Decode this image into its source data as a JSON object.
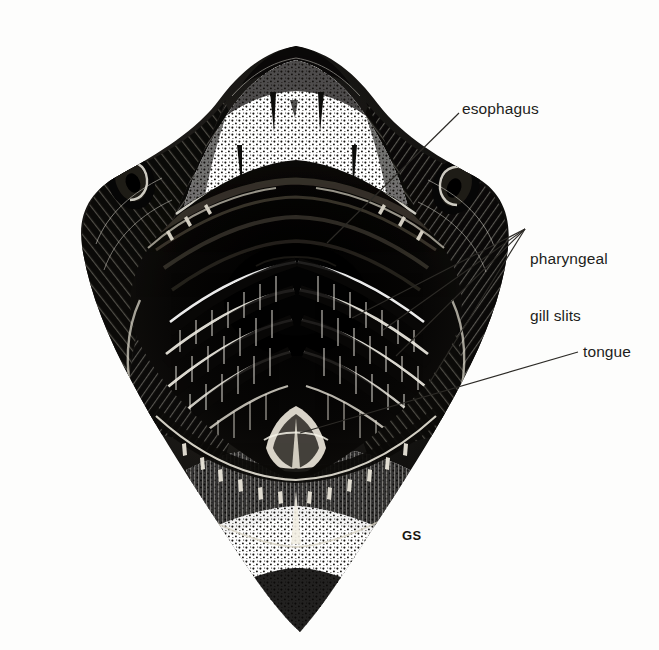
{
  "figure": {
    "medium": "pen-and-ink stipple and line engraving",
    "background_color": "#fdfdfc",
    "ink_color": "#111111",
    "signature": "GS"
  },
  "labels": {
    "esophagus": "esophagus",
    "gill_slits_line1": "pharyngeal",
    "gill_slits_line2": "gill slits",
    "tongue": "tongue"
  },
  "leaders": {
    "esophagus": {
      "from_x": 459,
      "from_y": 113,
      "to_x": 327,
      "to_y": 243
    },
    "gill_slits_hub_x": 525,
    "gill_slits_hub_y": 229,
    "gill_slit_targets": [
      {
        "x": 352,
        "y": 318
      },
      {
        "x": 383,
        "y": 330
      },
      {
        "x": 396,
        "y": 356
      },
      {
        "x": 430,
        "y": 382
      }
    ],
    "tongue": {
      "from_x": 578,
      "from_y": 352,
      "to_x": 300,
      "to_y": 433
    }
  },
  "anatomy": {
    "parts": [
      "snout",
      "upper jaw",
      "upper tooth rows",
      "oral cavity",
      "esophagus",
      "pharyngeal gill slits",
      "gill arches",
      "tongue (basihyal)",
      "lower jaw",
      "lower tooth rows",
      "left eye",
      "right eye"
    ],
    "head_bounds": {
      "left": 48,
      "top": 45,
      "right": 512,
      "bottom": 634
    },
    "snout_apex": {
      "x": 296,
      "y": 46
    },
    "left_eye": {
      "x": 131,
      "y": 181
    },
    "right_eye": {
      "x": 456,
      "y": 186
    },
    "gill_slit_count": 5
  }
}
